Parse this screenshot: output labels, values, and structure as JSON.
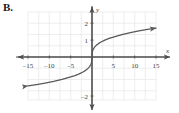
{
  "panel": {
    "label": "B."
  },
  "chart_data": {
    "type": "line",
    "title": "",
    "subtitle": "",
    "xlabel": "x",
    "ylabel": "y",
    "function_description": "cube root curve through the origin",
    "xlim": [
      -17,
      17
    ],
    "ylim": [
      -2.4,
      2.4
    ],
    "grid": true,
    "grid_step_x": 5,
    "grid_step_y": 1,
    "legend": null,
    "x_ticks": [
      -15,
      -10,
      -5,
      5,
      10,
      15
    ],
    "x_tick_labels": [
      "–15",
      "–10",
      "–5",
      "5",
      "10",
      "15"
    ],
    "y_ticks": [
      2,
      1,
      -2
    ],
    "y_tick_labels": [
      "2",
      "1",
      "–2"
    ],
    "series": [
      {
        "name": "y = cube root of x",
        "arrow_start": true,
        "arrow_end": true,
        "x": [
          -15,
          -13,
          -11,
          -9,
          -7,
          -5,
          -4,
          -3,
          -2,
          -1.5,
          -1,
          -0.6,
          -0.3,
          -0.1,
          0,
          0.1,
          0.3,
          0.6,
          1,
          1.5,
          2,
          3,
          4,
          5,
          7,
          9,
          11,
          13,
          15
        ],
        "y": [
          -1.71,
          -1.63,
          -1.54,
          -1.44,
          -1.32,
          -1.18,
          -1.1,
          -1.0,
          -0.87,
          -0.79,
          -0.69,
          -0.58,
          -0.46,
          -0.32,
          0,
          0.32,
          0.46,
          0.58,
          0.69,
          0.79,
          0.87,
          1.0,
          1.1,
          1.18,
          1.32,
          1.44,
          1.54,
          1.63,
          1.71
        ]
      }
    ],
    "colors": {
      "curve": "#585858",
      "axis": "#4d4d4d",
      "grid": "#e4e4e4",
      "text": "#444444",
      "background": "#ffffff"
    }
  }
}
